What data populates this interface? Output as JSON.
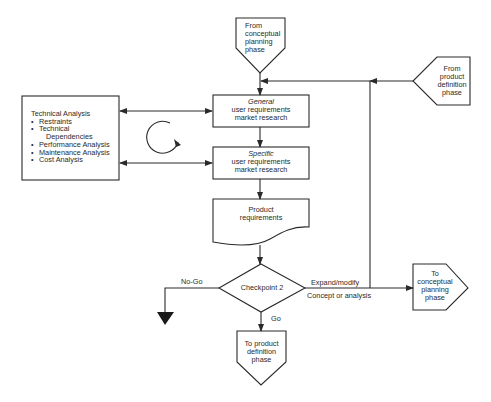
{
  "diagram": {
    "nodes": {
      "from_conceptual": {
        "lines": [
          "From",
          "conceptual",
          "planning",
          "phase"
        ],
        "shape": "off-page-connector-down"
      },
      "general": {
        "title": "General",
        "lines": [
          "user requirements",
          "market research"
        ],
        "shape": "process"
      },
      "specific": {
        "title": "Specific",
        "lines": [
          "user requirements",
          "market research"
        ],
        "shape": "process"
      },
      "product_requirements": {
        "lines": [
          "Product",
          "requirements"
        ],
        "shape": "document"
      },
      "checkpoint": {
        "label": "Checkpoint 2",
        "shape": "decision"
      },
      "to_product_definition": {
        "lines": [
          "To product",
          "definition",
          "phase"
        ],
        "shape": "off-page-connector-down"
      },
      "to_conceptual": {
        "lines": [
          "To",
          "conceptual",
          "planning",
          "phase"
        ],
        "shape": "off-page-connector-right"
      },
      "from_product_definition": {
        "lines": [
          "From",
          "product",
          "definition",
          "phase"
        ],
        "shape": "off-page-connector-left"
      },
      "technical_analysis": {
        "title": "Technical Analysis",
        "items": [
          "Restraints",
          "Technical",
          "Dependencies",
          "Performance Analysis",
          "Maintenance Analysis",
          "Cost Analysis"
        ],
        "shape": "process"
      },
      "terminate": {
        "shape": "filled-triangle"
      }
    },
    "edge_labels": {
      "no_go": "No-Go",
      "go": "Go",
      "expand": "Expand/modify",
      "concept": "Concept or analysis"
    },
    "edges": [
      {
        "from": "from_conceptual",
        "to": "general"
      },
      {
        "from": "general",
        "to": "specific"
      },
      {
        "from": "specific",
        "to": "product_requirements"
      },
      {
        "from": "product_requirements",
        "to": "checkpoint"
      },
      {
        "from": "checkpoint",
        "to": "to_product_definition",
        "label": "Go"
      },
      {
        "from": "checkpoint",
        "to": "terminate",
        "label": "No-Go"
      },
      {
        "from": "checkpoint",
        "to": "to_conceptual",
        "label": "Expand/modify / Concept or analysis"
      },
      {
        "from": "checkpoint",
        "to": "general",
        "label": "feedback loop"
      },
      {
        "from": "from_product_definition",
        "to": "general"
      },
      {
        "from": "technical_analysis",
        "to": "general",
        "bidirectional": true
      },
      {
        "from": "technical_analysis",
        "to": "specific",
        "bidirectional": true
      }
    ],
    "cycle_icon": "circular-arrow-icon",
    "colors": {
      "stroke": "#2a2a2a",
      "background": "#ffffff"
    }
  }
}
